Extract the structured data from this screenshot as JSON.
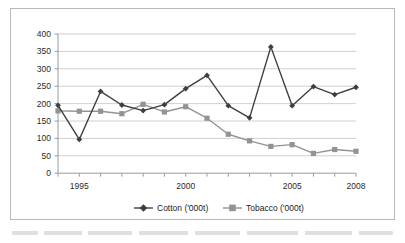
{
  "chart_data": {
    "type": "line",
    "title": "",
    "subtitle": "",
    "xlabel": "",
    "ylabel": "",
    "x": [
      1994,
      1995,
      1996,
      1997,
      1998,
      1999,
      2000,
      2001,
      2002,
      2003,
      2004,
      2005,
      2006,
      2007,
      2008
    ],
    "categories": [
      "1994",
      "1995",
      "1996",
      "1997",
      "1998",
      "1999",
      "2000",
      "2001",
      "2002",
      "2003",
      "2004",
      "2005",
      "2006",
      "2007",
      "2008"
    ],
    "series": [
      {
        "name": "Cotton ('000t)",
        "marker": "diamond",
        "color": "#3f3f3f",
        "values": [
          195,
          97,
          235,
          196,
          180,
          197,
          243,
          281,
          194,
          159,
          363,
          194,
          249,
          226,
          247
        ]
      },
      {
        "name": "Tobacco ('000t)",
        "marker": "square",
        "color": "#939393",
        "values": [
          179,
          178,
          178,
          171,
          198,
          176,
          191,
          158,
          112,
          93,
          77,
          82,
          57,
          68,
          63
        ]
      }
    ],
    "ylim": [
      0,
      400
    ],
    "ytick_step": 50,
    "yticks": [
      "0",
      "50",
      "100",
      "150",
      "200",
      "250",
      "300",
      "350",
      "400"
    ],
    "xtick_labels_shown": [
      "1995",
      "2000",
      "2005",
      "2008"
    ],
    "xlim": [
      1994,
      2008
    ],
    "grid": "horizontal",
    "legend_position": "bottom",
    "legend": [
      "Cotton ('000t)",
      "Tobacco ('000t)"
    ]
  },
  "chart": {
    "frame_border_color": "#b8b8b8",
    "gridline_color": "#c4c4c4",
    "axis_color": "#9a9a9a",
    "plot_background": "#ffffff"
  },
  "legend": {
    "items": [
      {
        "label": "Cotton ('000t)",
        "marker_name": "diamond-marker",
        "color": "#3f3f3f"
      },
      {
        "label": "Tobacco ('000t)",
        "marker_name": "square-marker",
        "color": "#939393"
      }
    ]
  }
}
